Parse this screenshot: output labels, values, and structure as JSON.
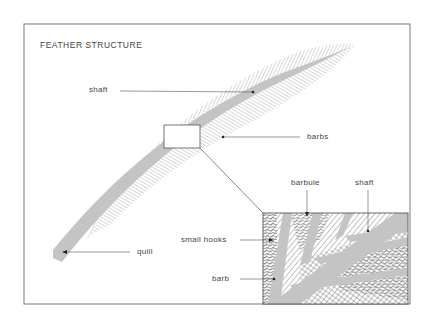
{
  "title": "FEATHER STRUCTURE",
  "labels": {
    "shaft_top": "shaft",
    "barbs": "barbs",
    "quill": "quill",
    "barbule": "barbule",
    "shaft_inset": "shaft",
    "small_hooks": "small hooks",
    "barb": "barb"
  },
  "colors": {
    "frame": "#555555",
    "shaft": "#c4c4c4",
    "hatch": "#9a9a9a",
    "text": "#444444"
  }
}
